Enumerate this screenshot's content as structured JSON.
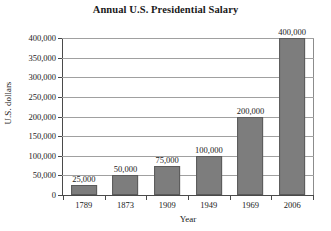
{
  "chart_data": {
    "type": "bar",
    "title": "Annual U.S. Presidential Salary",
    "xlabel": "Year",
    "ylabel": "U.S. dollars",
    "categories": [
      "1789",
      "1873",
      "1909",
      "1949",
      "1969",
      "2006"
    ],
    "values": [
      25000,
      50000,
      75000,
      100000,
      200000,
      400000
    ],
    "value_labels": [
      "25,000",
      "50,000",
      "75,000",
      "100,000",
      "200,000",
      "400,000"
    ],
    "ylim": [
      0,
      400000
    ],
    "ytick_values": [
      0,
      50000,
      100000,
      150000,
      200000,
      250000,
      300000,
      350000,
      400000
    ],
    "ytick_labels": [
      "0",
      "50,000",
      "100,000",
      "150,000",
      "200,000",
      "250,000",
      "300,000",
      "350,000",
      "400,000"
    ],
    "grid": true,
    "legend": false,
    "bar_color": "#7d7d7d",
    "bar_border_color": "#5a5a5a",
    "grid_color": "#a0a0a0",
    "axis_color": "#4a4a4a",
    "background": "#ffffff"
  }
}
